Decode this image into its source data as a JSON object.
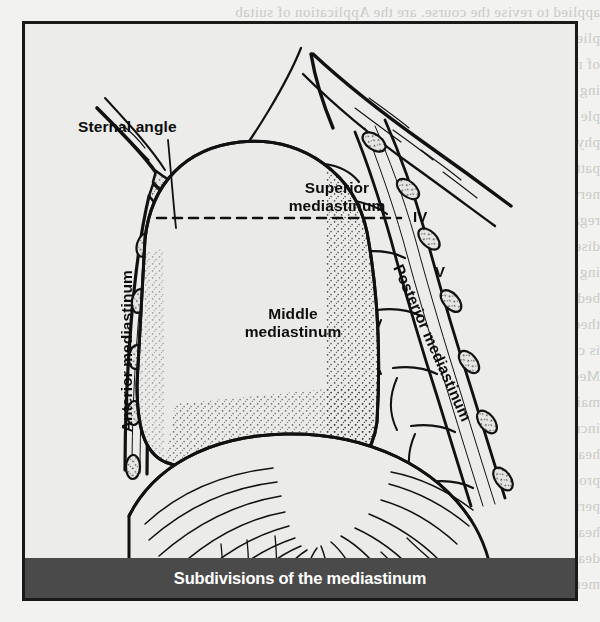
{
  "figure": {
    "caption": "Subdivisions of the mediastinum",
    "labels": {
      "sternal_angle": "Sternal angle",
      "superior_mediastinum": "Superior\nmediastinum",
      "middle_mediastinum": "Middle\nmediastinum",
      "anterior_mediastinum": "Anterior mediastinum",
      "posterior_mediastinum": "Posterior mediastinum",
      "vertebra_four": "IV",
      "vertebra_five": "V"
    },
    "colors": {
      "page_background": "#f2f2f0",
      "figure_background": "#ececeb",
      "frame": "#1a1a1a",
      "ink": "#0d0d0d",
      "caption_bar": "#4a4a4a",
      "caption_text": "#ffffff",
      "bleed_text": "#c9c9c5"
    }
  },
  "bleed_text": {
    "lines": [
      "applied to revise the course.        are the Application of suitab",
      "plied to revise. The course    proofile tree for better health",
      "of new management in     ne. are represent. Study w",
      "ing volume patches and   disease process and recogn",
      "ple as it applies to     therapeutic, and rehabilitat",
      "physiologic and pathologic    mechanisms, identificatio",
      "patterns of responses. Scientific knowledge and skill",
      "nervous system are used in the solution of problems",
      "regard to health promotion, maintenance, restoration",
      "disease, and care of the dying client. Advanced",
      "ing practice are integrated into the diagnosis",
      "bedside to the ambulatory. It begins to determine t",
      "theoretical basis for the intervention or prevention o",
      "is called for in the process of primary health care",
      "Medical science has expanded the concept of health p",
      "maintenance and improved the relationship between",
      "increased number of elderly and disabled clients an",
      "health care systems are expanded concerns indicates",
      "problems in the community and settings beyond",
      "period and the role of the nurse in the assessment",
      "health care needs of the population. The range",
      "dealing with first patient is demonstrated in the",
      "members of the family.        are Application of suitabl"
    ]
  }
}
